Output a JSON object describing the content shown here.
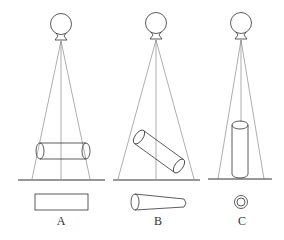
{
  "diagram": {
    "type": "projection-geometry",
    "panels": [
      {
        "id": "A",
        "label": "A",
        "object_orientation": "horizontal cylinder parallel to detector",
        "projection": "rectangle"
      },
      {
        "id": "B",
        "label": "B",
        "object_orientation": "tilted cylinder",
        "projection": "distorted tapered shape"
      },
      {
        "id": "C",
        "label": "C",
        "object_orientation": "vertical cylinder along central ray",
        "projection": "concentric circles"
      }
    ],
    "caption": "……"
  },
  "colors": {
    "stroke": "#333333",
    "ray": "#666666",
    "background": "#ffffff"
  }
}
